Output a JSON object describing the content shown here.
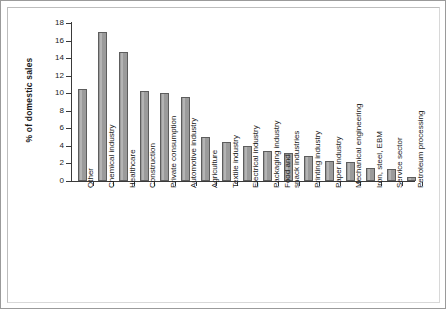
{
  "figure": {
    "frame_color": "#9a9a9a",
    "background": "#ffffff"
  },
  "chart_data": {
    "type": "bar",
    "title": "",
    "xlabel": "",
    "ylabel": "% of domestic sales",
    "ylim": [
      0,
      18
    ],
    "ytick_step": 2,
    "yticks": [
      "18",
      "16",
      "14",
      "12",
      "10",
      "8",
      "6",
      "4",
      "2",
      "0"
    ],
    "grid": false,
    "legend": false,
    "bar_color": "#9b9b9b",
    "bar_edge_color": "#5d5d5d",
    "categories": [
      "Other",
      "Chemical industry",
      "Healthcare",
      "Construction",
      "Private consumption",
      "Automotive industry",
      "Agriculture",
      "Textile industry",
      "Electrical industry",
      "Packaging industry",
      "Food and\nsnack industries",
      "Printing industry",
      "Paper industry",
      "Mechanical engineering",
      "Iron, steel, EBM",
      "Service sector",
      "Petroleum processing"
    ],
    "values": [
      10.5,
      17.0,
      14.7,
      10.2,
      10.0,
      9.6,
      5.0,
      4.4,
      4.0,
      3.4,
      3.2,
      2.8,
      2.3,
      2.2,
      1.5,
      1.4,
      0.5
    ]
  }
}
